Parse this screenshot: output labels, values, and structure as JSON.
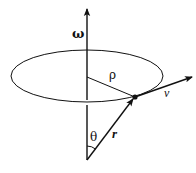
{
  "diagram": {
    "colors": {
      "stroke": "#111111",
      "background": "#ffffff"
    },
    "labels": {
      "omega": "ω",
      "rho": "ρ",
      "velocity": "v",
      "theta": "θ",
      "radius": "r"
    },
    "elements": {
      "axis": {
        "name": "omega-axis",
        "from": [
          87,
          160
        ],
        "to": [
          87,
          8
        ]
      },
      "orbit": {
        "name": "circular-orbit",
        "cx": 87,
        "cy": 76,
        "rx": 76,
        "ry": 26
      },
      "rho_line": {
        "from": [
          87,
          77
        ],
        "to": [
          135,
          97
        ]
      },
      "position_vector": {
        "from": [
          87,
          160
        ],
        "to": [
          135,
          97
        ]
      },
      "velocity_vector": {
        "from": [
          135,
          97
        ],
        "to": [
          192,
          77
        ]
      },
      "particle": {
        "at": [
          135,
          97
        ]
      },
      "theta_arc": {
        "center": [
          87,
          160
        ],
        "radius": 14
      }
    }
  }
}
